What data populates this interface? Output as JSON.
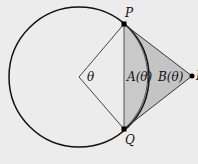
{
  "diagram": {
    "title": "",
    "labels": {
      "P": "P",
      "Q": "Q",
      "R": "R",
      "theta": "θ",
      "A": "A(θ)",
      "B": "B(θ)"
    },
    "geometry": {
      "center": [
        79,
        77
      ],
      "radius": 70,
      "P": [
        124,
        24
      ],
      "Q": [
        124,
        129
      ],
      "R": [
        192,
        76
      ]
    },
    "colors": {
      "background": "#ececec",
      "region_A": "#c9c9c9",
      "region_B": "#c4c4c4",
      "stroke": "#111111",
      "chord": "#555555"
    }
  }
}
